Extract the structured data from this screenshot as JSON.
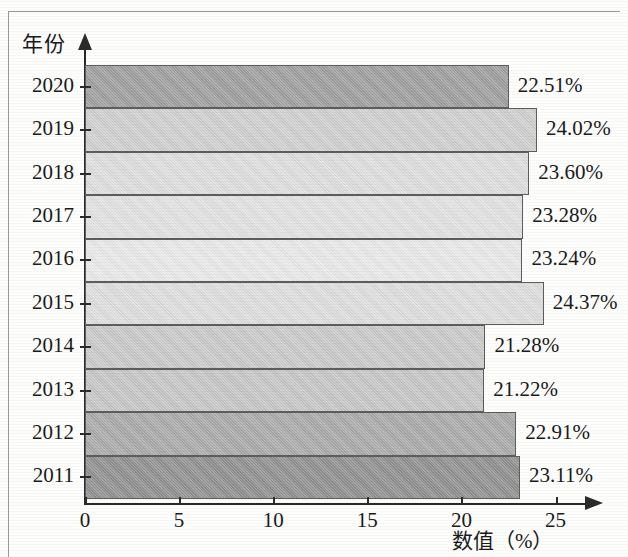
{
  "chart_data": {
    "type": "bar",
    "orientation": "horizontal",
    "title": "",
    "xlabel": "数值（%）",
    "ylabel": "年份",
    "categories": [
      "2020",
      "2019",
      "2018",
      "2017",
      "2016",
      "2015",
      "2014",
      "2013",
      "2012",
      "2011"
    ],
    "values": [
      22.51,
      24.02,
      23.6,
      23.28,
      23.24,
      24.37,
      21.28,
      21.22,
      22.91,
      23.11
    ],
    "value_labels": [
      "22.51%",
      "24.02%",
      "23.60%",
      "23.28%",
      "23.24%",
      "24.37%",
      "21.28%",
      "21.22%",
      "22.91%",
      "23.11%"
    ],
    "bar_colors": [
      "#9e9e9e",
      "#cfcfcf",
      "#dedede",
      "#e2e2e2",
      "#e9e9e9",
      "#dedede",
      "#c9c9c9",
      "#c6c6c6",
      "#a9a9a9",
      "#8f8f8f"
    ],
    "xlim": [
      0,
      26.8
    ],
    "xticks": [
      0,
      5,
      10,
      15,
      20,
      25
    ],
    "xtick_labels": [
      "0",
      "5",
      "10",
      "15",
      "20",
      "25"
    ],
    "grid": false,
    "legend": false,
    "axis_color": "#2b2b2b",
    "bar_edge_color": "#5d5d5d",
    "background": "#fdfdfc"
  }
}
